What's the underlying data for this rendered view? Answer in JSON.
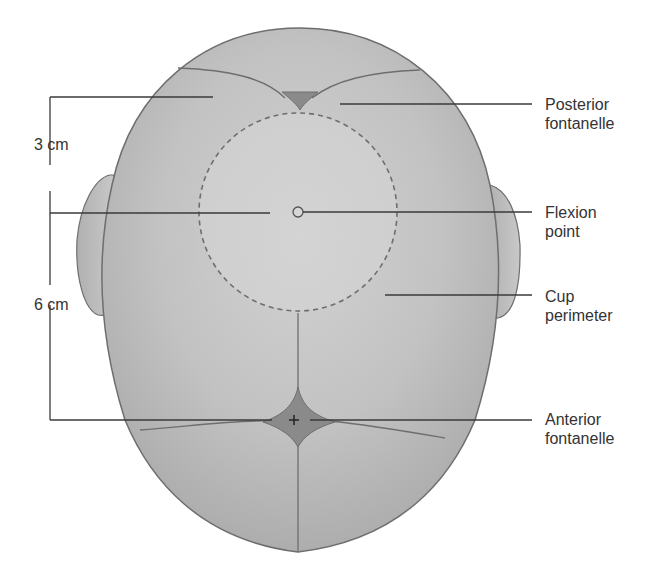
{
  "diagram": {
    "colors": {
      "background": "#ffffff",
      "head_fill": "#bdbdbd",
      "head_outline": "#6e6e6e",
      "cup_fill": "#d4d4d4",
      "fontanelle_fill": "#8a8a8a",
      "line": "#3a3a3a",
      "text": "#333333"
    },
    "dimensions": [
      {
        "id": "upper",
        "label": "3 cm"
      },
      {
        "id": "lower",
        "label": "6 cm"
      }
    ],
    "labels": [
      {
        "id": "posterior-fontanelle",
        "line1": "Posterior",
        "line2": "fontanelle"
      },
      {
        "id": "flexion-point",
        "line1": "Flexion",
        "line2": "point"
      },
      {
        "id": "cup-perimeter",
        "line1": "Cup",
        "line2": "perimeter"
      },
      {
        "id": "anterior-fontanelle",
        "line1": "Anterior",
        "line2": "fontanelle"
      }
    ]
  }
}
